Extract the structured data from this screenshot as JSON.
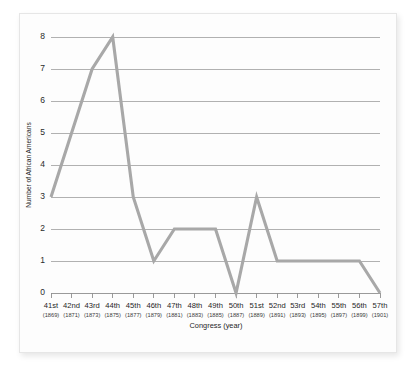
{
  "chart_data": {
    "type": "line",
    "title": "",
    "xlabel": "Congress (year)",
    "ylabel": "Number of African Americans",
    "categories": [
      "41st",
      "42nd",
      "43rd",
      "44th",
      "45th",
      "46th",
      "47th",
      "48th",
      "49th",
      "50th",
      "51st",
      "52nd",
      "53rd",
      "54th",
      "55th",
      "56th",
      "57th"
    ],
    "x_sublabels": [
      "(1869)",
      "(1871)",
      "(1873)",
      "(1875)",
      "(1877)",
      "(1879)",
      "(1881)",
      "(1883)",
      "(1885)",
      "(1887)",
      "(1889)",
      "(1891)",
      "(1893)",
      "(1895)",
      "(1897)",
      "(1899)",
      "(1901)"
    ],
    "values": [
      3,
      5,
      7,
      8,
      3,
      1,
      2,
      2,
      2,
      0,
      3,
      1,
      1,
      1,
      1,
      1,
      0
    ],
    "ytick_labels": [
      "0",
      "1",
      "2",
      "3",
      "4",
      "5",
      "6",
      "7",
      "8"
    ],
    "ytick_values": [
      0,
      1,
      2,
      3,
      4,
      5,
      6,
      7,
      8
    ],
    "ylim": [
      0,
      8
    ],
    "grid": true,
    "legend": "none",
    "series_name": "Number of African Americans",
    "line_color": "#a8a8a8",
    "grid_color": "#9d9d9d",
    "axis_color": "#8f8f8f",
    "background_color": "#fdfdfd"
  }
}
